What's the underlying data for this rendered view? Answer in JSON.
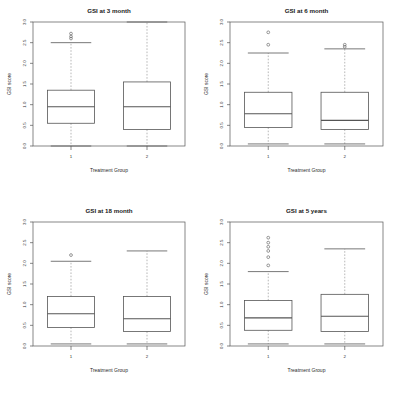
{
  "figure": {
    "layout": "2x2 panel grid",
    "background": "#ffffff",
    "line_color": "#555555",
    "whisker_color": "#9a9a9a"
  },
  "chart_data": [
    {
      "type": "box",
      "panel": "top-left",
      "title": "GSI at 3 month",
      "xlabel": "Treatment Group",
      "ylabel": "GSI score",
      "categories": [
        "1",
        "2"
      ],
      "ylim": [
        0.0,
        3.0
      ],
      "yticks": [
        0.0,
        0.5,
        1.0,
        1.5,
        2.0,
        2.5,
        3.0
      ],
      "yticklabels": [
        "0.0",
        "0.5",
        "1.0",
        "1.5",
        "2.0",
        "2.5",
        "3.0"
      ],
      "grid": false,
      "legend": "none",
      "boxes": [
        {
          "category": "1",
          "whisker_low": 0.0,
          "q1": 0.55,
          "median": 0.95,
          "q3": 1.35,
          "whisker_high": 2.5,
          "outliers": [
            2.6,
            2.65,
            2.72
          ]
        },
        {
          "category": "2",
          "whisker_low": 0.0,
          "q1": 0.4,
          "median": 0.95,
          "q3": 1.55,
          "whisker_high": 3.0,
          "outliers": []
        }
      ]
    },
    {
      "type": "box",
      "panel": "top-right",
      "title": "GSI at 6 month",
      "xlabel": "Treatment Group",
      "ylabel": "GSI score",
      "categories": [
        "1",
        "2"
      ],
      "ylim": [
        0.0,
        3.0
      ],
      "yticks": [
        0.0,
        0.5,
        1.0,
        1.5,
        2.0,
        2.5,
        3.0
      ],
      "yticklabels": [
        "0.0",
        "0.5",
        "1.0",
        "1.5",
        "2.0",
        "2.5",
        "3.0"
      ],
      "grid": false,
      "legend": "none",
      "boxes": [
        {
          "category": "1",
          "whisker_low": 0.05,
          "q1": 0.45,
          "median": 0.78,
          "q3": 1.3,
          "whisker_high": 2.25,
          "outliers": [
            2.45,
            2.75
          ]
        },
        {
          "category": "2",
          "whisker_low": 0.05,
          "q1": 0.4,
          "median": 0.62,
          "q3": 1.3,
          "whisker_high": 2.35,
          "outliers": [
            2.4,
            2.45
          ]
        }
      ]
    },
    {
      "type": "box",
      "panel": "bottom-left",
      "title": "GSI at 18 month",
      "xlabel": "Treatment Group",
      "ylabel": "GSI score",
      "categories": [
        "1",
        "2"
      ],
      "ylim": [
        0.0,
        3.0
      ],
      "yticks": [
        0.0,
        0.5,
        1.0,
        1.5,
        2.0,
        2.5,
        3.0
      ],
      "yticklabels": [
        "0.0",
        "0.5",
        "1.0",
        "1.5",
        "2.0",
        "2.5",
        "3.0"
      ],
      "grid": false,
      "legend": "none",
      "boxes": [
        {
          "category": "1",
          "whisker_low": 0.05,
          "q1": 0.45,
          "median": 0.78,
          "q3": 1.2,
          "whisker_high": 2.05,
          "outliers": [
            2.2
          ]
        },
        {
          "category": "2",
          "whisker_low": 0.05,
          "q1": 0.35,
          "median": 0.66,
          "q3": 1.2,
          "whisker_high": 2.3,
          "outliers": []
        }
      ]
    },
    {
      "type": "box",
      "panel": "bottom-right",
      "title": "GSI at 5 years",
      "xlabel": "Treatment Group",
      "ylabel": "GSI score",
      "categories": [
        "1",
        "2"
      ],
      "ylim": [
        0.0,
        3.0
      ],
      "yticks": [
        0.0,
        0.5,
        1.0,
        1.5,
        2.0,
        2.5,
        3.0
      ],
      "yticklabels": [
        "0.0",
        "0.5",
        "1.0",
        "1.5",
        "2.0",
        "2.5",
        "3.0"
      ],
      "grid": false,
      "legend": "none",
      "boxes": [
        {
          "category": "1",
          "whisker_low": 0.05,
          "q1": 0.38,
          "median": 0.68,
          "q3": 1.1,
          "whisker_high": 1.8,
          "outliers": [
            1.95,
            2.15,
            2.3,
            2.4,
            2.5,
            2.62
          ]
        },
        {
          "category": "2",
          "whisker_low": 0.05,
          "q1": 0.35,
          "median": 0.72,
          "q3": 1.25,
          "whisker_high": 2.35,
          "outliers": []
        }
      ]
    }
  ]
}
